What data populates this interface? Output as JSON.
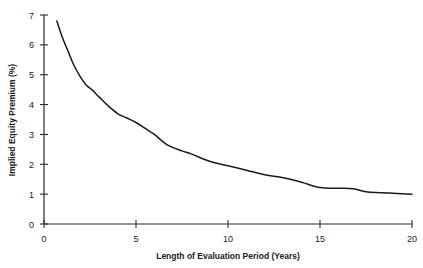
{
  "chart_data": {
    "type": "line",
    "title": "",
    "xlabel": "Length of Evaluation Period (Years)",
    "ylabel": "Implied Equity Premium (%)",
    "xlim": [
      0,
      20
    ],
    "ylim": [
      0,
      7
    ],
    "xticks": [
      0,
      5,
      10,
      15,
      20
    ],
    "yticks": [
      0,
      1,
      2,
      3,
      4,
      5,
      6,
      7
    ],
    "xtick_labels": [
      "0",
      "5",
      "10",
      "15",
      "20"
    ],
    "ytick_labels": [
      "0",
      "1",
      "2",
      "3",
      "4",
      "5",
      "6",
      "7"
    ],
    "grid": false,
    "legend": null,
    "series": [
      {
        "name": "Implied Equity Premium",
        "color": "#1a1a1a",
        "x": [
          0.7,
          1.0,
          1.3,
          1.6,
          2.0,
          2.3,
          2.6,
          3.0,
          3.5,
          4.0,
          4.5,
          5.0,
          5.5,
          6.0,
          6.7,
          7.5,
          8.0,
          9.0,
          10.0,
          11.0,
          12.0,
          13.0,
          14.0,
          15.0,
          16.0,
          16.8,
          17.5,
          18.3,
          19.2,
          20.0
        ],
        "y": [
          6.8,
          6.25,
          5.8,
          5.35,
          4.9,
          4.65,
          4.5,
          4.25,
          3.95,
          3.7,
          3.55,
          3.4,
          3.2,
          3.0,
          2.65,
          2.45,
          2.35,
          2.1,
          1.95,
          1.8,
          1.65,
          1.55,
          1.4,
          1.22,
          1.2,
          1.18,
          1.08,
          1.05,
          1.02,
          1.0
        ]
      }
    ]
  },
  "axes": {
    "y_axis_title": "Implied Equity Premium (%)",
    "x_axis_title": "Length of Evaluation Period (Years)"
  }
}
